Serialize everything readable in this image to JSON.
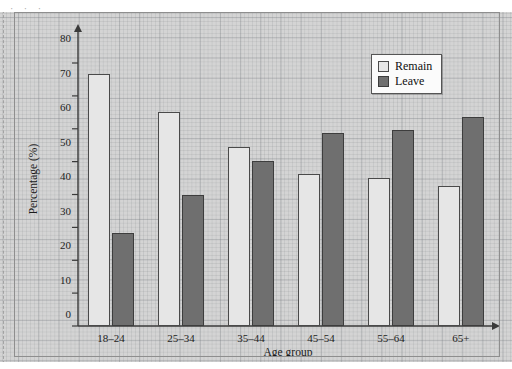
{
  "scan": {
    "top_sliver_text": "· · ·"
  },
  "chart_data": {
    "type": "bar",
    "title": "",
    "xlabel": "Age group",
    "ylabel": "Percentage (%)",
    "categories": [
      "18–24",
      "25–34",
      "35–44",
      "45–54",
      "55–64",
      "65+"
    ],
    "series": [
      {
        "name": "Remain",
        "color": "#e6e6e6",
        "values": [
          73,
          62,
          52,
          44,
          43,
          40.5
        ]
      },
      {
        "name": "Leave",
        "color": "#6f6f6f",
        "values": [
          27,
          38,
          48,
          56,
          57,
          60.5
        ]
      }
    ],
    "ylim": [
      0,
      85
    ],
    "yticks": [
      0,
      10,
      20,
      30,
      40,
      50,
      60,
      70,
      80
    ],
    "ytick_labels": [
      "0",
      "10",
      "20",
      "30",
      "40",
      "50",
      "60",
      "70",
      "80"
    ],
    "grid": true,
    "grid_style": "graph-paper",
    "legend_position": "top-right",
    "legend_entries": [
      "Remain",
      "Leave"
    ],
    "axis_arrows": true
  }
}
